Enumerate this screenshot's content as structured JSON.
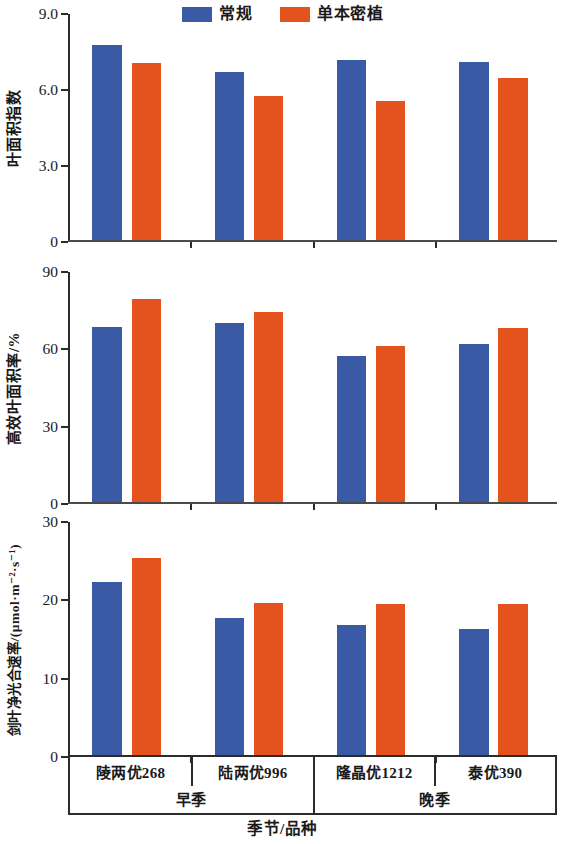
{
  "colors": {
    "regular": "#3a5aa6",
    "dense": "#e4531d",
    "axis": "#2b2b2b",
    "background": "#ffffff"
  },
  "legend": {
    "entries": [
      {
        "label": "常规",
        "color": "#3a5aa6"
      },
      {
        "label": "单本密植",
        "color": "#e4531d"
      }
    ]
  },
  "xaxis": {
    "title": "季节/品种",
    "varieties": [
      "陵两优268",
      "陆两优996",
      "隆晶优1212",
      "泰优390"
    ],
    "seasons": [
      "早季",
      "晚季"
    ]
  },
  "chart_data": [
    {
      "type": "bar",
      "title": "",
      "panel": "a",
      "xlabel": "季节/品种",
      "ylabel": "叶面积指数",
      "categories": [
        "陵两优268",
        "陆两优996",
        "隆晶优1212",
        "泰优390"
      ],
      "group_labels": [
        "早季",
        "早季",
        "晚季",
        "晚季"
      ],
      "ylim": [
        0,
        9.0
      ],
      "yticks": [
        "0",
        "3.0",
        "6.0",
        "9.0"
      ],
      "ytick_values": [
        0,
        3.0,
        6.0,
        9.0
      ],
      "grid": false,
      "legend_position": "top-center",
      "series": [
        {
          "name": "常规",
          "color": "#3a5aa6",
          "values": [
            7.75,
            6.7,
            7.15,
            7.1
          ]
        },
        {
          "name": "单本密植",
          "color": "#e4531d",
          "values": [
            7.05,
            5.72,
            5.52,
            6.45
          ]
        }
      ]
    },
    {
      "type": "bar",
      "title": "",
      "panel": "b",
      "xlabel": "季节/品种",
      "ylabel": "高效叶面积率/%",
      "categories": [
        "陵两优268",
        "陆两优996",
        "隆晶优1212",
        "泰优390"
      ],
      "group_labels": [
        "早季",
        "早季",
        "晚季",
        "晚季"
      ],
      "ylim": [
        0,
        90
      ],
      "yticks": [
        "0",
        "30",
        "60",
        "90"
      ],
      "ytick_values": [
        0,
        30,
        60,
        90
      ],
      "grid": false,
      "legend_position": "top-center",
      "series": [
        {
          "name": "常规",
          "color": "#3a5aa6",
          "values": [
            68.5,
            70.0,
            57.0,
            62.0
          ]
        },
        {
          "name": "单本密植",
          "color": "#e4531d",
          "values": [
            79.5,
            74.5,
            61.0,
            68.0
          ]
        }
      ]
    },
    {
      "type": "bar",
      "title": "",
      "panel": "c",
      "xlabel": "季节/品种",
      "ylabel": "剑叶净光合速率/(μmol·m⁻²·s⁻¹)",
      "categories": [
        "陵两优268",
        "陆两优996",
        "隆晶优1212",
        "泰优390"
      ],
      "group_labels": [
        "早季",
        "早季",
        "晚季",
        "晚季"
      ],
      "ylim": [
        0,
        30
      ],
      "yticks": [
        "0",
        "10",
        "20",
        "30"
      ],
      "ytick_values": [
        0,
        10,
        20,
        30
      ],
      "grid": false,
      "legend_position": "top-center",
      "series": [
        {
          "name": "常规",
          "color": "#3a5aa6",
          "values": [
            22.3,
            17.6,
            16.7,
            16.2
          ]
        },
        {
          "name": "单本密植",
          "color": "#e4531d",
          "values": [
            25.4,
            19.6,
            19.5,
            19.4
          ]
        }
      ]
    }
  ],
  "panel_geometry": [
    {
      "top": 14,
      "height": 228
    },
    {
      "top": 272,
      "height": 232
    },
    {
      "top": 522,
      "height": 235
    }
  ]
}
